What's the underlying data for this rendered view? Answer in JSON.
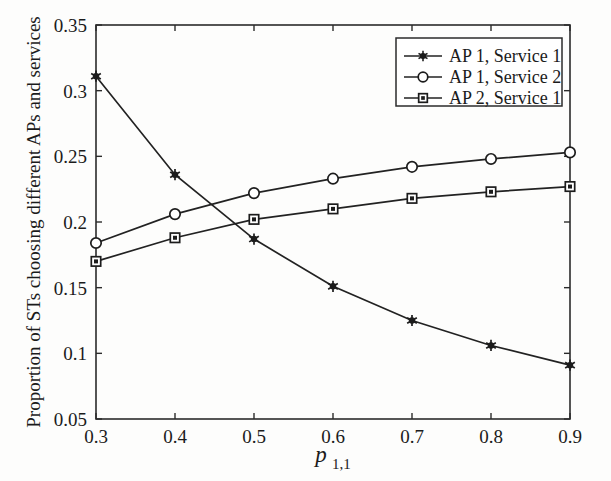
{
  "chart_data": {
    "type": "line",
    "title": "",
    "xlabel": "p_{1,1}",
    "xlabel_main": "p",
    "xlabel_sub": "1,1",
    "ylabel": "Proportion of STs choosing different APs and services",
    "x": [
      0.3,
      0.4,
      0.5,
      0.6,
      0.7,
      0.8,
      0.9
    ],
    "xlim": [
      0.3,
      0.9
    ],
    "ylim": [
      0.05,
      0.35
    ],
    "xticks": [
      "0.3",
      "0.4",
      "0.5",
      "0.6",
      "0.7",
      "0.8",
      "0.9"
    ],
    "yticks": [
      "0.05",
      "0.1",
      "0.15",
      "0.2",
      "0.25",
      "0.3",
      "0.35"
    ],
    "ytick_values": [
      0.05,
      0.1,
      0.15,
      0.2,
      0.25,
      0.3,
      0.35
    ],
    "grid": false,
    "legend_position": "top-right",
    "series": [
      {
        "name": "AP 1, Service 1",
        "marker": "star",
        "values": [
          0.311,
          0.236,
          0.187,
          0.151,
          0.125,
          0.106,
          0.091
        ]
      },
      {
        "name": "AP 1, Service 2",
        "marker": "circle",
        "values": [
          0.184,
          0.206,
          0.222,
          0.233,
          0.242,
          0.248,
          0.253
        ]
      },
      {
        "name": "AP 2, Service 1",
        "marker": "square",
        "values": [
          0.17,
          0.188,
          0.202,
          0.21,
          0.218,
          0.223,
          0.227
        ]
      }
    ],
    "colors": {
      "line": "#222222",
      "axis": "#2b2b2b",
      "background": "#fdfdfc",
      "text": "#1b1b1b"
    }
  }
}
